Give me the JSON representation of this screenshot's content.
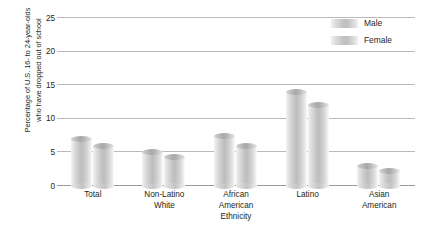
{
  "chart_data": {
    "type": "bar",
    "title": "",
    "xlabel": "Ethnicity",
    "ylabel": "Percentage of U.S. 16- to 24-year-olds\nwho have dropped out of school",
    "categories": [
      "Total",
      "Non-Latino\nWhite",
      "African\nAmerican",
      "Latino",
      "Asian\nAmerican"
    ],
    "series": [
      {
        "name": "Male",
        "values": [
          7.0,
          5.0,
          7.5,
          14.0,
          3.0
        ]
      },
      {
        "name": "Female",
        "values": [
          6.0,
          4.3,
          6.0,
          12.0,
          2.3
        ]
      }
    ],
    "ylim": [
      0,
      25
    ],
    "yticks": [
      0,
      5,
      10,
      15,
      20,
      25
    ],
    "ytick_labels": [
      "0",
      "5",
      "10",
      "15",
      "20",
      "25"
    ],
    "grid": true,
    "legend_position": "top-right",
    "colors": {
      "bar_light": "#f3f3f3",
      "bar_mid": "#bdbdbd",
      "bar_cap": "#a8a8a8",
      "gridline": "#b9b9b9",
      "text": "#231f20"
    }
  },
  "legend": {
    "items": [
      {
        "label": "Male"
      },
      {
        "label": "Female"
      }
    ]
  }
}
